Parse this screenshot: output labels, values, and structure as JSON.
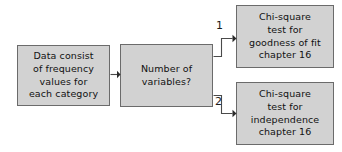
{
  "diagram": {
    "background_color": "#ffffff",
    "node_fill_color": "#d2d2d2",
    "node_border_color": "#6b6b6b",
    "edge_color": "#4a4a4a",
    "text_color": "#111111",
    "nodes": [
      {
        "id": "source",
        "name": "data-description-box",
        "text": "Data consist\nof frequency\nvalues for\neach category"
      },
      {
        "id": "decision",
        "name": "decision-box",
        "text": "Number of\nvariables?"
      },
      {
        "id": "goodness_of_fit",
        "name": "goodness-of-fit-box",
        "text": "Chi-square\ntest for\ngoodness of fit\nchapter 16"
      },
      {
        "id": "independence",
        "name": "independence-box",
        "text": "Chi-square\ntest for\nindependence\nchapter 16"
      }
    ],
    "edges": [
      {
        "id": "source_to_decision",
        "from": "source",
        "to": "decision",
        "label": ""
      },
      {
        "id": "decision_to_goodness_of_fit",
        "from": "decision",
        "to": "goodness_of_fit",
        "label": "1"
      },
      {
        "id": "decision_to_independence",
        "from": "decision",
        "to": "independence",
        "label": "2"
      }
    ]
  }
}
